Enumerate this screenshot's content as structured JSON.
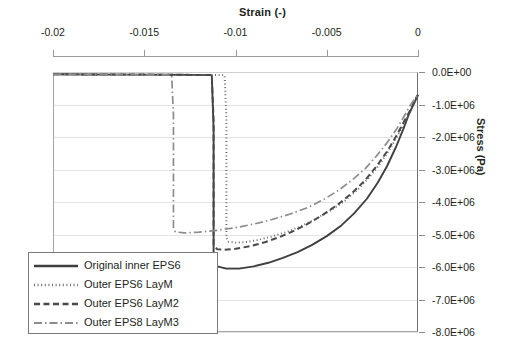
{
  "chart_data": {
    "type": "line",
    "title": "",
    "xlabel": "Strain (-)",
    "ylabel": "Stress (Pa)",
    "xlim": [
      -0.02,
      0
    ],
    "ylim": [
      -8000000,
      0
    ],
    "xticks": [
      "-0.02",
      "-0.015",
      "-0.01",
      "-0.005",
      "0"
    ],
    "xtick_values": [
      -0.02,
      -0.015,
      -0.01,
      -0.005,
      0
    ],
    "yticks": [
      "0.0E+00",
      "-1.0E+06",
      "-2.0E+06",
      "-3.0E+06",
      "-4.0E+06",
      "-5.0E+06",
      "-6.0E+06",
      "-7.0E+06",
      "-8.0E+06"
    ],
    "ytick_values": [
      0,
      -1000000,
      -2000000,
      -3000000,
      -4000000,
      -5000000,
      -6000000,
      -7000000,
      -8000000
    ],
    "grid": true,
    "legend_position": "lower-left",
    "xaxis_position": "top",
    "yaxis_position": "right",
    "series": [
      {
        "name": "Original inner EPS6",
        "style": "solid",
        "color": "#3f3f3f",
        "points": [
          [
            -0.02,
            -70000
          ],
          [
            -0.018,
            -75000
          ],
          [
            -0.016,
            -80000
          ],
          [
            -0.014,
            -85000
          ],
          [
            -0.0125,
            -90000
          ],
          [
            -0.0113,
            -95000
          ],
          [
            -0.0112,
            -1750000
          ],
          [
            -0.0112,
            -3600000
          ],
          [
            -0.0112,
            -5050000
          ],
          [
            -0.0112,
            -5750000
          ],
          [
            -0.011,
            -5980000
          ],
          [
            -0.0105,
            -6050000
          ],
          [
            -0.0098,
            -6050000
          ],
          [
            -0.009,
            -5980000
          ],
          [
            -0.0082,
            -5870000
          ],
          [
            -0.0074,
            -5720000
          ],
          [
            -0.0066,
            -5540000
          ],
          [
            -0.0058,
            -5320000
          ],
          [
            -0.005,
            -5050000
          ],
          [
            -0.0042,
            -4720000
          ],
          [
            -0.0035,
            -4350000
          ],
          [
            -0.0028,
            -3900000
          ],
          [
            -0.0022,
            -3400000
          ],
          [
            -0.0017,
            -2900000
          ],
          [
            -0.0012,
            -2300000
          ],
          [
            -0.0008,
            -1750000
          ],
          [
            -0.0005,
            -1300000
          ],
          [
            -0.0002,
            -950000
          ],
          [
            0,
            -700000
          ]
        ]
      },
      {
        "name": "Outer EPS6 LayM",
        "style": "dotted",
        "color": "#6b6b6b",
        "points": [
          [
            -0.02,
            -70000
          ],
          [
            -0.0175,
            -75000
          ],
          [
            -0.015,
            -80000
          ],
          [
            -0.013,
            -85000
          ],
          [
            -0.012,
            -90000
          ],
          [
            -0.0106,
            -95000
          ],
          [
            -0.0105,
            -1400000
          ],
          [
            -0.0105,
            -3000000
          ],
          [
            -0.0105,
            -4300000
          ],
          [
            -0.0105,
            -5100000
          ],
          [
            -0.0104,
            -5220000
          ],
          [
            -0.01,
            -5250000
          ],
          [
            -0.0094,
            -5230000
          ],
          [
            -0.0088,
            -5170000
          ],
          [
            -0.008,
            -5060000
          ],
          [
            -0.0072,
            -4920000
          ],
          [
            -0.0064,
            -4740000
          ],
          [
            -0.0056,
            -4520000
          ],
          [
            -0.0048,
            -4260000
          ],
          [
            -0.004,
            -3960000
          ],
          [
            -0.0033,
            -3620000
          ],
          [
            -0.0027,
            -3260000
          ],
          [
            -0.0021,
            -2840000
          ],
          [
            -0.0016,
            -2420000
          ],
          [
            -0.0011,
            -1950000
          ],
          [
            -0.0007,
            -1520000
          ],
          [
            -0.0004,
            -1180000
          ],
          [
            -0.0002,
            -920000
          ],
          [
            0,
            -700000
          ]
        ]
      },
      {
        "name": "Outer EPS6 LayM2",
        "style": "dashed",
        "color": "#4a4a4a",
        "points": [
          [
            -0.02,
            -70000
          ],
          [
            -0.0175,
            -75000
          ],
          [
            -0.015,
            -80000
          ],
          [
            -0.0132,
            -85000
          ],
          [
            -0.0122,
            -90000
          ],
          [
            -0.0113,
            -95000
          ],
          [
            -0.0112,
            -1500000
          ],
          [
            -0.0112,
            -3200000
          ],
          [
            -0.0112,
            -4600000
          ],
          [
            -0.0112,
            -5350000
          ],
          [
            -0.011,
            -5450000
          ],
          [
            -0.0106,
            -5470000
          ],
          [
            -0.01,
            -5440000
          ],
          [
            -0.0092,
            -5360000
          ],
          [
            -0.0084,
            -5240000
          ],
          [
            -0.0076,
            -5080000
          ],
          [
            -0.0068,
            -4890000
          ],
          [
            -0.006,
            -4660000
          ],
          [
            -0.0052,
            -4390000
          ],
          [
            -0.0044,
            -4080000
          ],
          [
            -0.0036,
            -3720000
          ],
          [
            -0.0029,
            -3330000
          ],
          [
            -0.0023,
            -2920000
          ],
          [
            -0.0017,
            -2450000
          ],
          [
            -0.0012,
            -1980000
          ],
          [
            -0.0008,
            -1560000
          ],
          [
            -0.0004,
            -1150000
          ],
          [
            -0.0002,
            -900000
          ],
          [
            0,
            -700000
          ]
        ]
      },
      {
        "name": "Outer EPS8 LayM3",
        "style": "dashdot",
        "color": "#8c8c8c",
        "points": [
          [
            -0.02,
            -70000
          ],
          [
            -0.0185,
            -75000
          ],
          [
            -0.017,
            -80000
          ],
          [
            -0.0155,
            -85000
          ],
          [
            -0.0143,
            -90000
          ],
          [
            -0.0135,
            -95000
          ],
          [
            -0.0134,
            -1300000
          ],
          [
            -0.0134,
            -2800000
          ],
          [
            -0.0134,
            -4100000
          ],
          [
            -0.0134,
            -4800000
          ],
          [
            -0.0133,
            -4920000
          ],
          [
            -0.0128,
            -4950000
          ],
          [
            -0.012,
            -4930000
          ],
          [
            -0.011,
            -4870000
          ],
          [
            -0.01,
            -4790000
          ],
          [
            -0.009,
            -4680000
          ],
          [
            -0.008,
            -4540000
          ],
          [
            -0.007,
            -4370000
          ],
          [
            -0.006,
            -4160000
          ],
          [
            -0.0051,
            -3900000
          ],
          [
            -0.0043,
            -3620000
          ],
          [
            -0.0036,
            -3320000
          ],
          [
            -0.0029,
            -2980000
          ],
          [
            -0.0023,
            -2600000
          ],
          [
            -0.0017,
            -2180000
          ],
          [
            -0.0012,
            -1780000
          ],
          [
            -0.0008,
            -1400000
          ],
          [
            -0.0004,
            -1000000
          ],
          [
            0,
            -700000
          ]
        ]
      }
    ]
  }
}
